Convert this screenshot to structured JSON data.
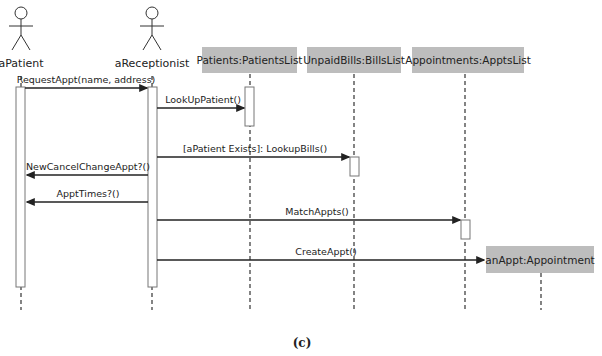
{
  "diagram": {
    "type": "sequence",
    "caption": "(c)",
    "actors": [
      {
        "id": "aPatient",
        "label": "aPatient",
        "x": 21
      },
      {
        "id": "aReceptionist",
        "label": "aReceptionist",
        "x": 152
      }
    ],
    "objects": [
      {
        "id": "patients",
        "label": "Patients:PatientsList",
        "x": 250
      },
      {
        "id": "bills",
        "label": "UnpaidBills:BillsList",
        "x": 354
      },
      {
        "id": "appts",
        "label": "Appointments:ApptsList",
        "x": 465
      },
      {
        "id": "appointment",
        "label": "anAppt:Appointment",
        "x": 541
      }
    ],
    "messages": [
      {
        "label": "RequestAppt(name, address)",
        "from": "aPatient",
        "to": "aReceptionist"
      },
      {
        "label": "LookUpPatient()",
        "from": "aReceptionist",
        "to": "patients"
      },
      {
        "label": "[aPatient Exists]: LookupBills()",
        "from": "aReceptionist",
        "to": "bills"
      },
      {
        "label": "NewCancelChangeAppt?()",
        "from": "aReceptionist",
        "to": "aPatient"
      },
      {
        "label": "ApptTimes?()",
        "from": "aReceptionist",
        "to": "aPatient"
      },
      {
        "label": "MatchAppts()",
        "from": "aReceptionist",
        "to": "appts"
      },
      {
        "label": "CreateAppt()",
        "from": "aReceptionist",
        "to": "appointment"
      }
    ]
  }
}
